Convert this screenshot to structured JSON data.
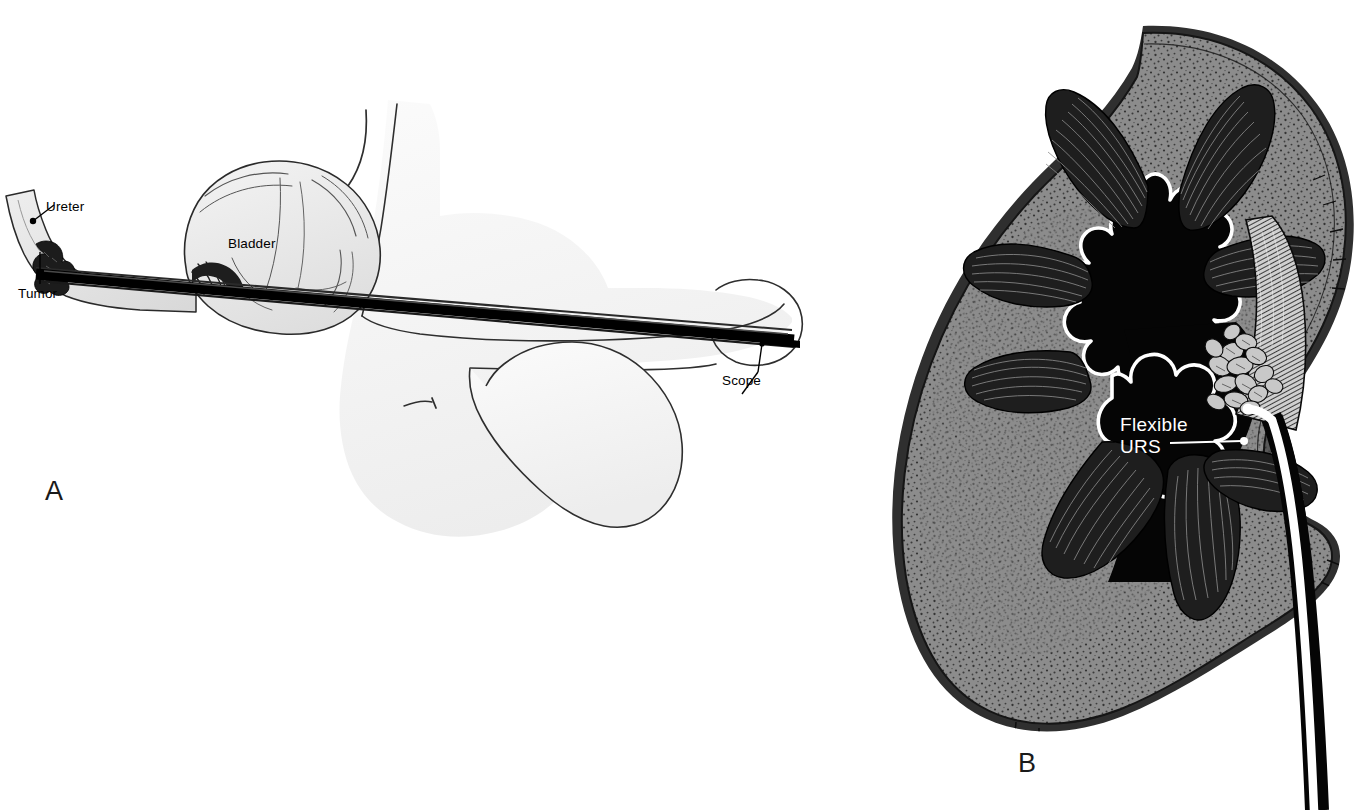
{
  "figure": {
    "type": "medical-illustration",
    "background_color": "#ffffff"
  },
  "panels": [
    {
      "id": "A",
      "letter": "A",
      "title": "Cystoscopic / rigid scope access through urethra and bladder to distal ureter",
      "view": "sagittal male lower urinary tract",
      "labels": [
        {
          "key": "ureter",
          "text": "Ureter",
          "color": "#000000",
          "leader": "dot"
        },
        {
          "key": "tumor",
          "text": "Tumor",
          "color": "#000000",
          "leader": "line"
        },
        {
          "key": "bladder",
          "text": "Bladder",
          "color": "#000000",
          "leader": "none"
        },
        {
          "key": "scope",
          "text": "Scope",
          "color": "#000000",
          "leader": "arrow"
        }
      ]
    },
    {
      "id": "B",
      "letter": "B",
      "title": "Flexible ureteroscope advanced retrograde into renal pelvis to upper pole tumor",
      "view": "coronal section of kidney",
      "labels": [
        {
          "key": "flexible_urs",
          "text_line_1": "Flexible",
          "text_line_2": "URS",
          "color": "#ffffff",
          "leader": "dot"
        }
      ]
    }
  ],
  "colors": {
    "ink": "#000000",
    "paper": "#ffffff",
    "tissue_fill": "#f3f3f3",
    "bladder_fill": "#e6e6e6",
    "kidney_cortex": "#8c8c8c",
    "kidney_cortex_dark": "#6f6f6f",
    "kidney_capsule": "#3a3a3a",
    "renal_pelvis": "#050505",
    "pelvis_outline": "#ffffff",
    "pyramid": "#2a2a2a",
    "label_white": "#ffffff",
    "label_black": "#000000"
  },
  "structures": {
    "panel_a": [
      "ureter",
      "ureteral tumor",
      "bladder",
      "bladder neck",
      "urethra",
      "penis",
      "scrotum",
      "rigid scope shaft"
    ],
    "panel_b": [
      "renal capsule",
      "renal cortex",
      "renal pyramids",
      "renal calyces",
      "renal pelvis",
      "upper pole tumor",
      "ureter",
      "flexible ureteroscope"
    ]
  }
}
